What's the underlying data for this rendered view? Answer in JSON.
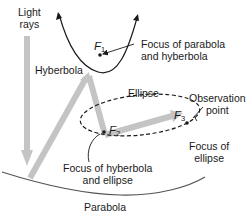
{
  "diagram": {
    "labels": {
      "light_rays": [
        "Light",
        "rays"
      ],
      "hyperbola": "Hyberbola",
      "ellipse": "Ellipse",
      "parabola": "Parabola",
      "observation_point": [
        "Observation",
        "point"
      ],
      "focus_parabola_hyperbola": [
        "Focus of parabola",
        "and hyberbola"
      ],
      "focus_hyperbola_ellipse": [
        "Focus of hyberbola",
        "and ellipse"
      ],
      "focus_ellipse": [
        "Focus of",
        "ellipse"
      ]
    },
    "foci": {
      "f1": {
        "letter": "F",
        "sub": "1"
      },
      "f2": {
        "letter": "F",
        "sub": "2"
      },
      "f3": {
        "letter": "F",
        "sub": "3"
      }
    },
    "colors": {
      "curve": "#1a1a1a",
      "ray": "#c4c4c4",
      "text": "#1a1a1a",
      "background": "#ffffff"
    }
  }
}
